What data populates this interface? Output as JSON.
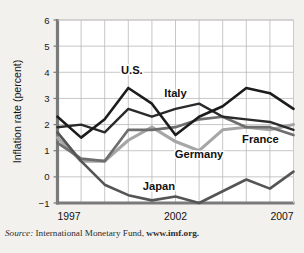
{
  "figure": {
    "ghost_caption": "",
    "source_prefix": "Source:",
    "source_text": "International Monetary Fund,",
    "source_link": "www.imf.org."
  },
  "chart_data": {
    "type": "line",
    "title": "",
    "xlabel": "",
    "ylabel": "Inflation rate (percent)",
    "xlim": [
      1997,
      2007
    ],
    "ylim": [
      -1,
      6
    ],
    "grid": true,
    "legend": "inline-labels",
    "x": [
      1997,
      1998,
      1999,
      2000,
      2001,
      2002,
      2003,
      2004,
      2005,
      2006,
      2007
    ],
    "xticks": [
      1997,
      2002,
      2007
    ],
    "xticklabels": [
      "1997",
      "2002",
      "2007"
    ],
    "yticks": [
      -1,
      0,
      1,
      2,
      3,
      4,
      5,
      6
    ],
    "yticklabels": [
      "−1",
      "0",
      "1",
      "2",
      "3",
      "4",
      "5",
      "6"
    ],
    "series": [
      {
        "name": "U.S.",
        "color": "#1c1c1c",
        "width": 2.6,
        "label_x": 2000.15,
        "label_y": 3.95,
        "values": [
          2.3,
          1.5,
          2.2,
          3.4,
          2.8,
          1.6,
          2.3,
          2.7,
          3.4,
          3.2,
          2.6
        ]
      },
      {
        "name": "Italy",
        "color": "#2a2a2a",
        "width": 2.4,
        "label_x": 2002.0,
        "label_y": 3.05,
        "values": [
          1.9,
          2.0,
          1.7,
          2.6,
          2.3,
          2.6,
          2.8,
          2.3,
          2.2,
          2.1,
          1.8
        ]
      },
      {
        "name": "France",
        "color": "#6e6e6e",
        "width": 2.7,
        "label_x": 2005.6,
        "label_y": 1.28,
        "values": [
          1.3,
          0.7,
          0.6,
          1.8,
          1.8,
          1.9,
          2.2,
          2.3,
          1.9,
          1.9,
          1.6
        ]
      },
      {
        "name": "Germany",
        "color": "#a6a6a6",
        "width": 3.1,
        "label_x": 2003.0,
        "label_y": 0.72,
        "values": [
          1.5,
          0.6,
          0.6,
          1.4,
          1.9,
          1.35,
          1.0,
          1.8,
          1.9,
          1.8,
          2.0
        ]
      },
      {
        "name": "Japan",
        "color": "#555555",
        "width": 2.6,
        "label_x": 2001.3,
        "label_y": -0.52,
        "values": [
          1.7,
          0.6,
          -0.3,
          -0.7,
          -0.9,
          -0.75,
          -1.0,
          -0.55,
          -0.1,
          -0.45,
          0.2
        ]
      }
    ]
  }
}
